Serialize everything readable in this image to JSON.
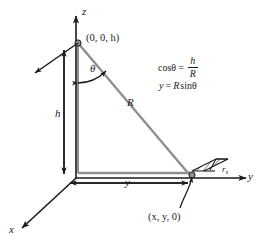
{
  "figure": {
    "background_color": "#ffffff",
    "line_color": "#1a1a1a",
    "ray_color": "#8f8f8f",
    "axes": [
      {
        "name": "z-axis",
        "label": "z",
        "direction": "up"
      },
      {
        "name": "y-axis",
        "label": "y",
        "direction": "right"
      },
      {
        "name": "x-axis",
        "label": "x",
        "direction": "down-left"
      }
    ],
    "labels": {
      "z_axis": "z",
      "y_axis": "y",
      "x_axis": "x",
      "apex_point": "(0, 0, h)",
      "ground_point": "(x, y, 0)",
      "height": "h",
      "ground_range": "y",
      "slant_range": "R",
      "angle": "θ",
      "patch": "r",
      "patch_sub": "s"
    },
    "formulas": {
      "line1_lhs": "cosθ",
      "line1_eq": "=",
      "line1_num": "h",
      "line1_den": "R",
      "line2": "y = R sinθ",
      "line2_lhs": "y",
      "line2_eq": "=",
      "line2_rhs_r": "R",
      "line2_rhs_sin": "sinθ"
    }
  }
}
